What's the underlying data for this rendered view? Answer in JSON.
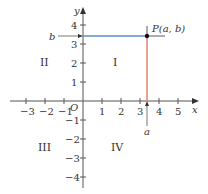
{
  "diagram": {
    "axes": {
      "x_label": "x",
      "y_label": "y",
      "origin_label": "O",
      "x_ticks": [
        "−3",
        "−2",
        "−1",
        "1",
        "2",
        "3",
        "4",
        "5"
      ],
      "y_ticks_positive": [
        "1",
        "2",
        "3",
        "4"
      ],
      "y_ticks_negative": [
        "−1",
        "−2",
        "−3",
        "−4"
      ]
    },
    "quadrants": {
      "I": "I",
      "II": "II",
      "III": "III",
      "IV": "IV"
    },
    "point": {
      "label": "P(a, b)",
      "x_label": "a",
      "y_label": "b",
      "x": 3.4,
      "y": 3.6
    },
    "colors": {
      "axis": "#555555",
      "horizontal_guide": "#5b8fc9",
      "vertical_guide": "#e8836d",
      "point": "#111111"
    }
  }
}
